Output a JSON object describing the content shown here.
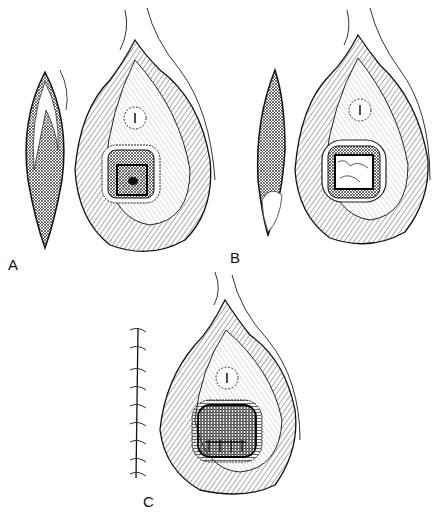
{
  "figure": {
    "type": "surgical illustration",
    "panels": [
      {
        "id": "A",
        "label": "A",
        "description": "Graft harvested beside perineal wound with rectangular defect and small dark opening"
      },
      {
        "id": "B",
        "label": "B",
        "description": "Donor site open, graft placed within rectangular defect"
      },
      {
        "id": "C",
        "label": "C",
        "description": "Donor site closed with sutures; graft sutured in place"
      }
    ],
    "colors": {
      "ink": "#1a1a1a",
      "background": "#ffffff",
      "hatch": "#555555"
    }
  }
}
